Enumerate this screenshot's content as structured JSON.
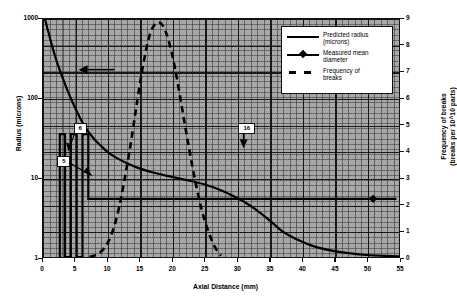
{
  "chart_data": {
    "type": "line",
    "title": "",
    "xlabel": "Axial Distance (mm)",
    "ylabel": "Radius (microns)",
    "ylabel_right_line1": "Frequency of breaks",
    "ylabel_right_line2": "(breaks per 10^10 parts)",
    "xlim": [
      0,
      55
    ],
    "xticks": [
      "0",
      "5",
      "10",
      "15",
      "20",
      "25",
      "30",
      "35",
      "40",
      "45",
      "50",
      "55"
    ],
    "xtick_values": [
      0,
      5,
      10,
      15,
      20,
      25,
      30,
      35,
      40,
      45,
      50,
      55
    ],
    "yscale_left": "log",
    "ylim_left": [
      1,
      1000
    ],
    "yticks_left": [
      "1",
      "10",
      "100",
      "1000"
    ],
    "ytick_values_left": [
      1,
      10,
      100,
      1000
    ],
    "yscale_right": "linear",
    "ylim_right": [
      0,
      9
    ],
    "yticks_right": [
      "0",
      "1",
      "2",
      "3",
      "4",
      "5",
      "6",
      "7",
      "8",
      "9"
    ],
    "ytick_values_right": [
      0,
      1,
      2,
      3,
      4,
      5,
      6,
      7,
      8,
      9
    ],
    "grid": true,
    "grid_style": "dense major and minor gridlines, gray plot background",
    "legend_position": "top-right inside plot",
    "series": [
      {
        "name": "Predicted radius (microns)",
        "axis": "left",
        "style": "solid",
        "x": [
          0.3,
          0.8,
          1.5,
          2.2,
          3.0,
          3.8,
          4.6,
          5.4,
          6.2,
          7.0,
          8.0,
          9.0,
          10.0,
          11.5,
          13.0,
          15.0,
          17.0,
          19.0,
          21.0,
          23.0,
          25.0,
          27.0,
          29.0,
          31.0,
          33.0,
          35.0,
          37.0,
          39.0,
          42.0,
          46.0,
          50.0,
          55.0
        ],
        "y": [
          1000,
          700,
          430,
          280,
          185,
          125,
          88,
          64,
          48,
          38,
          30,
          25,
          21,
          17.5,
          15.2,
          13.0,
          11.6,
          10.6,
          9.8,
          9.0,
          8.2,
          7.2,
          6.1,
          5.0,
          3.9,
          2.9,
          2.1,
          1.7,
          1.35,
          1.15,
          1.06,
          1.02
        ]
      },
      {
        "name": "Measured mean diameter",
        "axis": "right",
        "style": "solid with diamond markers",
        "x": [
          2.6,
          2.6,
          3.4,
          3.4,
          4.3,
          4.3,
          5.2,
          5.2,
          6.1,
          6.1,
          7.0,
          7.0,
          51.0,
          54.6
        ],
        "y": [
          0.0,
          4.65,
          4.65,
          0.0,
          0.0,
          4.65,
          4.65,
          0.0,
          0.0,
          4.65,
          4.65,
          2.2,
          2.2,
          2.2
        ],
        "markers": [
          {
            "x": 51.0,
            "y": 2.2
          }
        ]
      },
      {
        "name": "Frequency of breaks",
        "axis": "right",
        "style": "dashed",
        "x": [
          7.2,
          8.5,
          9.5,
          10.5,
          11.5,
          12.5,
          13.5,
          14.5,
          15.5,
          16.5,
          17.5,
          18.5,
          19.5,
          20.5,
          21.5,
          22.5,
          23.5,
          24.5,
          25.5,
          26.5,
          27.5
        ],
        "y": [
          0.0,
          0.12,
          0.35,
          0.8,
          1.6,
          2.8,
          4.2,
          5.8,
          7.3,
          8.4,
          8.85,
          8.75,
          8.1,
          7.0,
          5.6,
          4.2,
          2.9,
          1.8,
          1.0,
          0.4,
          0.05
        ]
      }
    ],
    "annotations": [
      {
        "name": "predicted-radius-arrow",
        "label": "",
        "x": 5.5,
        "y_left": 230,
        "note": "left-pointing arrow indicating predicted radius curve uses left axis"
      },
      {
        "name": "callout-6",
        "label": "6",
        "x": 5.4,
        "y_left": 44
      },
      {
        "name": "callout-5",
        "label": "5",
        "x": 2.9,
        "y_left": 17
      },
      {
        "name": "callout-16",
        "label": "16",
        "x": 31.0,
        "y_right": 4.9
      }
    ]
  },
  "legend": {
    "items": [
      {
        "key": "line-solid-key",
        "label_line1": "Predicted radius",
        "label_line2": "(microns)"
      },
      {
        "key": "line-marker-key",
        "label_line1": "Measured mean",
        "label_line2": "diameter"
      },
      {
        "key": "line-dashed-key",
        "label_line1": "Frequency of",
        "label_line2": "breaks"
      }
    ]
  },
  "colors": {
    "plot_background": "#a8a8a8",
    "series_line": "#000000",
    "axis": "#111111",
    "legend_background": "#ffffff",
    "page_background": "#ffffff"
  }
}
